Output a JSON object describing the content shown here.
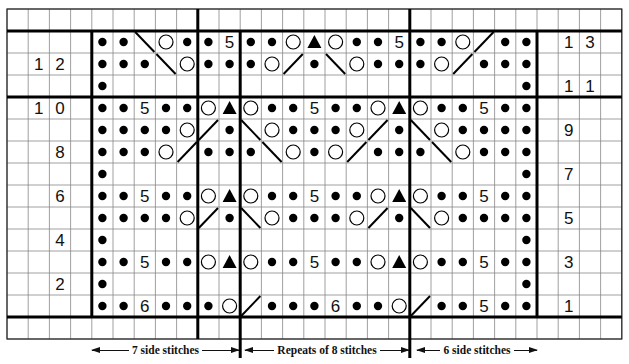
{
  "chart_title": "Knitting lace chart",
  "grid": {
    "columns": 29,
    "rows": 15,
    "chart_first_col": 4,
    "chart_last_col": 24
  },
  "legend_symbols": {
    "dot": "knit stitch (●)",
    "circle": "yarn over (○)",
    "triangle": "decrease (▲)",
    "slash": "right-slanting decrease (/)",
    "backslash": "left-slanting decrease (\\)",
    "number": "count of stitches"
  },
  "row_labels_left": [
    {
      "row": 12,
      "text": "12"
    },
    {
      "row": 10,
      "text": "10"
    },
    {
      "row": 8,
      "text": "8"
    },
    {
      "row": 6,
      "text": "6"
    },
    {
      "row": 4,
      "text": "4"
    },
    {
      "row": 2,
      "text": "2"
    }
  ],
  "row_labels_right": [
    {
      "row": 13,
      "text": "13"
    },
    {
      "row": 11,
      "text": "11"
    },
    {
      "row": 9,
      "text": "9"
    },
    {
      "row": 7,
      "text": "7"
    },
    {
      "row": 5,
      "text": "5"
    },
    {
      "row": 3,
      "text": "3"
    },
    {
      "row": 1,
      "text": "1"
    }
  ],
  "chart_rows": [
    {
      "row": 13,
      "cells": [
        "●",
        "●",
        "\\",
        "○",
        "●",
        "●",
        "5",
        "●",
        "●",
        "○",
        "▲",
        "○",
        "●",
        "●",
        "5",
        "●",
        "●",
        "○",
        "/",
        "●",
        "●"
      ]
    },
    {
      "row": 12,
      "cells": [
        "●",
        "●",
        "●",
        "\\",
        "○",
        "●",
        "●",
        "●",
        "○",
        "/",
        "●",
        "\\",
        "○",
        "●",
        "●",
        "●",
        "○",
        "/",
        "●",
        "●",
        "●"
      ]
    },
    {
      "row": 11,
      "cells": [
        "●",
        "",
        "",
        "",
        "",
        "",
        "",
        "",
        "",
        "",
        "",
        "",
        "",
        "",
        "",
        "",
        "",
        "",
        "",
        "",
        "●"
      ]
    },
    {
      "row": 10,
      "cells": [
        "●",
        "●",
        "5",
        "●",
        "●",
        "○",
        "▲",
        "○",
        "●",
        "●",
        "5",
        "●",
        "●",
        "○",
        "▲",
        "○",
        "●",
        "●",
        "5",
        "●",
        "●"
      ]
    },
    {
      "row": 9,
      "cells": [
        "●",
        "●",
        "●",
        "●",
        "○",
        "/",
        "●",
        "\\",
        "○",
        "●",
        "●",
        "●",
        "○",
        "/",
        "●",
        "\\",
        "○",
        "●",
        "●",
        "●",
        "●"
      ]
    },
    {
      "row": 8,
      "cells": [
        "●",
        "●",
        "●",
        "○",
        "/",
        "●",
        "●",
        "●",
        "\\",
        "○",
        "●",
        "○",
        "/",
        "●",
        "●",
        "●",
        "\\",
        "○",
        "●",
        "●",
        "●"
      ]
    },
    {
      "row": 7,
      "cells": [
        "●",
        "",
        "",
        "",
        "",
        "",
        "",
        "",
        "",
        "",
        "",
        "",
        "",
        "",
        "",
        "",
        "",
        "",
        "",
        "",
        "●"
      ]
    },
    {
      "row": 6,
      "cells": [
        "●",
        "●",
        "5",
        "●",
        "●",
        "○",
        "▲",
        "○",
        "●",
        "●",
        "5",
        "●",
        "●",
        "○",
        "▲",
        "○",
        "●",
        "●",
        "5",
        "●",
        "●"
      ]
    },
    {
      "row": 5,
      "cells": [
        "●",
        "●",
        "●",
        "●",
        "○",
        "/",
        "●",
        "\\",
        "○",
        "●",
        "●",
        "●",
        "○",
        "/",
        "●",
        "\\",
        "○",
        "●",
        "●",
        "●",
        "●"
      ]
    },
    {
      "row": 4,
      "cells": [
        "●",
        "",
        "",
        "",
        "",
        "",
        "",
        "",
        "",
        "",
        "",
        "",
        "",
        "",
        "",
        "",
        "",
        "",
        "",
        "",
        "●"
      ]
    },
    {
      "row": 3,
      "cells": [
        "●",
        "●",
        "5",
        "●",
        "●",
        "○",
        "▲",
        "○",
        "●",
        "●",
        "5",
        "●",
        "●",
        "○",
        "▲",
        "○",
        "●",
        "●",
        "5",
        "●",
        "●"
      ]
    },
    {
      "row": 2,
      "cells": [
        "●",
        "",
        "",
        "",
        "",
        "",
        "",
        "",
        "",
        "",
        "",
        "",
        "",
        "",
        "",
        "",
        "",
        "",
        "",
        "",
        "●"
      ]
    },
    {
      "row": 1,
      "cells": [
        "●",
        "●",
        "6",
        "●",
        "●",
        "●",
        "○",
        "/",
        "●",
        "●",
        "●",
        "6",
        "●",
        "●",
        "○",
        "/",
        "●",
        "●",
        "5",
        "●",
        "●"
      ]
    }
  ],
  "footer": {
    "left": "7 side stitches",
    "middle": "Repeats of 8 stitches",
    "right": "6 side stitches"
  }
}
